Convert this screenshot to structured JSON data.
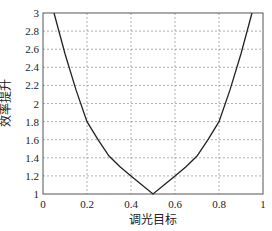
{
  "chart_data": {
    "type": "line",
    "title": "",
    "xlabel": "调光目标",
    "ylabel": "效率提升",
    "xlim": [
      0,
      1
    ],
    "ylim": [
      1,
      3
    ],
    "xticks": [
      "0",
      "0.2",
      "0.4",
      "0.6",
      "0.8",
      "1"
    ],
    "yticks": [
      "1",
      "1.2",
      "1.4",
      "1.6",
      "1.8",
      "2",
      "2.2",
      "2.4",
      "2.6",
      "2.8",
      "3"
    ],
    "grid": true,
    "series": [
      {
        "name": "效率提升",
        "x": [
          0.05,
          0.1,
          0.15,
          0.2,
          0.25,
          0.3,
          0.35,
          0.4,
          0.45,
          0.5,
          0.55,
          0.6,
          0.65,
          0.7,
          0.75,
          0.8,
          0.85,
          0.9,
          0.95
        ],
        "y": [
          3.0,
          2.55,
          2.15,
          1.8,
          1.6,
          1.42,
          1.3,
          1.2,
          1.1,
          1.0,
          1.1,
          1.2,
          1.3,
          1.42,
          1.6,
          1.8,
          2.15,
          2.55,
          3.0
        ]
      }
    ]
  },
  "colors": {
    "line": "#222222",
    "grid": "#999999",
    "axis": "#555555"
  }
}
